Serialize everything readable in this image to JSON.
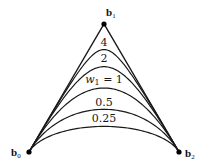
{
  "diagram": {
    "type": "rational-quadratic-bezier-weights",
    "control_points": [
      {
        "name": "b",
        "sub": "0",
        "x": 29,
        "y": 152,
        "label_x": 11,
        "label_y": 156
      },
      {
        "name": "b",
        "sub": "1",
        "x": 104,
        "y": 24,
        "label_x": 106,
        "label_y": 16
      },
      {
        "name": "b",
        "sub": "2",
        "x": 179,
        "y": 152,
        "label_x": 185,
        "label_y": 157
      }
    ],
    "curves": [
      {
        "weight": 4,
        "label": "4",
        "label_x": 104,
        "label_y": 46
      },
      {
        "weight": 2,
        "label": "2",
        "label_x": 104,
        "label_y": 62
      },
      {
        "weight": 1,
        "label_prefix": "w",
        "label_sub": "1",
        "label_suffix": " = 1",
        "label_x": 104,
        "label_y": 83
      },
      {
        "weight": 0.5,
        "label": "0.5",
        "label_x": 104,
        "label_y": 106
      },
      {
        "weight": 0.25,
        "label": "0.25",
        "label_x": 104,
        "label_y": 122
      }
    ],
    "colors": {
      "stroke": "#1a1a1a",
      "point": "#000000"
    }
  }
}
